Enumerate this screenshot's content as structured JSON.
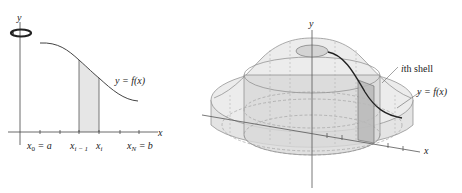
{
  "left_figure": {
    "y_axis_label": "y",
    "x_axis_label": "x",
    "curve_label": "y = f(x)",
    "tick_labels": {
      "x0": "x",
      "x0_sub": "0",
      "x0_eq": " = a",
      "xim1": "x",
      "xim1_sub": "i − 1",
      "xi": "x",
      "xi_sub": "i",
      "xN": "x",
      "xN_sub": "N",
      "xN_eq": " = b"
    },
    "rotation_icon": "rotation-arrow-icon",
    "shade_color": "#e6e6e6"
  },
  "right_figure": {
    "y_axis_label": "y",
    "x_axis_label": "x",
    "shell_label_italic": "i",
    "shell_label_rest": "th shell",
    "curve_label": "y = f(x)",
    "solid_color": "#e2e2e2",
    "shell_color": "#c8c8c8"
  }
}
